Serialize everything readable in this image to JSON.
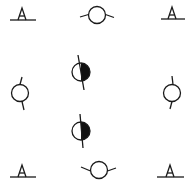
{
  "diagram": {
    "stroke_color": "#1a1a1a",
    "fill_color": "#111111",
    "background": "#ffffff",
    "symbols": [
      {
        "type": "triangle-on-line",
        "x": 22,
        "y": 14
      },
      {
        "type": "circle-horizontal-ticks",
        "x": 97,
        "y": 15
      },
      {
        "type": "triangle-on-line",
        "x": 173,
        "y": 14
      },
      {
        "type": "circle-vertical-ticks",
        "x": 21,
        "y": 93
      },
      {
        "type": "half-filled-circle",
        "x": 80,
        "y": 72
      },
      {
        "type": "circle-vertical-ticks",
        "x": 172,
        "y": 93
      },
      {
        "type": "half-filled-circle",
        "x": 80,
        "y": 131
      },
      {
        "type": "triangle-on-line",
        "x": 22,
        "y": 180
      },
      {
        "type": "circle-horizontal-ticks",
        "x": 97,
        "y": 178
      },
      {
        "type": "triangle-on-line",
        "x": 171,
        "y": 179
      }
    ]
  }
}
